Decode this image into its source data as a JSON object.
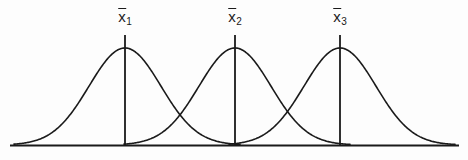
{
  "figure": {
    "title": "",
    "background_color": "#fdfdfd",
    "stroke_color": "#1a1a1a",
    "width": 468,
    "height": 160
  },
  "labels": [
    {
      "id": "mean-1",
      "symbol": "x",
      "subscript": "1",
      "text": "x̅1",
      "x": 125,
      "y": 8
    },
    {
      "id": "mean-2",
      "symbol": "x",
      "subscript": "2",
      "text": "x̅2",
      "x": 235,
      "y": 8
    },
    {
      "id": "mean-3",
      "symbol": "x",
      "subscript": "3",
      "text": "x̅3",
      "x": 340,
      "y": 8
    }
  ],
  "chart_data": {
    "type": "line",
    "title": "",
    "subtitle": "",
    "xlabel": "",
    "ylabel": "",
    "grid": false,
    "legend": "none",
    "axis": {
      "baseline_y": 145,
      "baseline_x_start": 11,
      "baseline_x_end": 458,
      "xlim": [
        0,
        468
      ],
      "ylim": [
        0,
        160
      ],
      "y_inverted": true
    },
    "annotations": [
      {
        "label": "x̅1",
        "x": 125,
        "type": "mean-marker",
        "line_top_y": 35,
        "line_bottom_y": 145
      },
      {
        "label": "x̅2",
        "x": 235,
        "type": "mean-marker",
        "line_top_y": 35,
        "line_bottom_y": 145
      },
      {
        "label": "x̅3",
        "x": 340,
        "type": "mean-marker",
        "line_top_y": 35,
        "line_bottom_y": 145
      }
    ],
    "series": [
      {
        "name": "distribution-1",
        "label": "x̅1",
        "distribution": "normal",
        "mean": 125,
        "sigma": 36,
        "peak_x": 125,
        "peak_y": 48,
        "x_start": 14,
        "x_end": 240
      },
      {
        "name": "distribution-2",
        "label": "x̅2",
        "distribution": "normal",
        "mean": 235,
        "sigma": 36,
        "peak_x": 235,
        "peak_y": 48,
        "x_start": 124,
        "x_end": 350
      },
      {
        "name": "distribution-3",
        "label": "x̅3",
        "distribution": "normal",
        "mean": 340,
        "sigma": 36,
        "peak_x": 340,
        "peak_y": 48,
        "x_start": 229,
        "x_end": 455
      }
    ]
  }
}
